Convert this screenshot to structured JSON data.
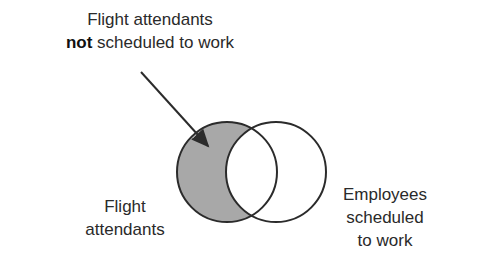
{
  "diagram": {
    "type": "venn",
    "callout": {
      "line1": "Flight attendants",
      "line2_bold": "not",
      "line2_rest": " scheduled to work"
    },
    "left_set": {
      "line1": "Flight",
      "line2": "attendants"
    },
    "right_set": {
      "line1": "Employees",
      "line2": "scheduled",
      "line3": "to work"
    },
    "shaded_region": "left-only",
    "colors": {
      "shade": "#a8a8a8",
      "stroke": "#2b2b2b",
      "background": "#ffffff"
    }
  }
}
